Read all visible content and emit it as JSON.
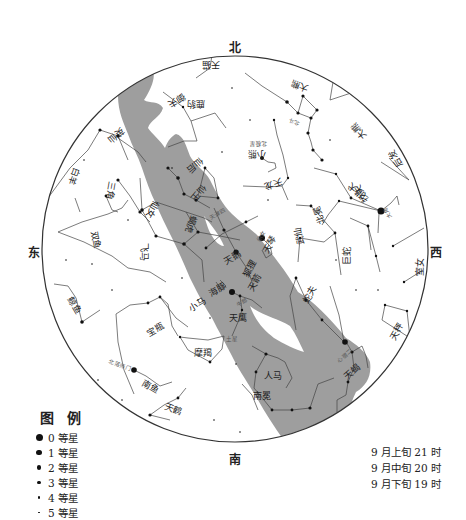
{
  "chart": {
    "center": [
      235,
      249
    ],
    "radius": 193,
    "milky_way_color": "#9e9e9e",
    "line_color": "#444444",
    "star_color": "#111111"
  },
  "cardinals": {
    "north": "北",
    "south": "南",
    "east": "东",
    "west": "西"
  },
  "legend": {
    "title": "图 例",
    "items": [
      {
        "label": "0 等星",
        "size": 7
      },
      {
        "label": "1 等星",
        "size": 5.5
      },
      {
        "label": "2 等星",
        "size": 4.2
      },
      {
        "label": "3 等星",
        "size": 3.2
      },
      {
        "label": "4 等星",
        "size": 2.4
      },
      {
        "label": "5 等星",
        "size": 1.6
      }
    ]
  },
  "time_notes": [
    "9 月上旬 21 时",
    "9 月中旬 20 时",
    "9 月下旬 19 时"
  ],
  "constellations": [
    {
      "name": "天猫",
      "x": 211,
      "y": 64,
      "rot": 180
    },
    {
      "name": "鹿豹",
      "x": 196,
      "y": 103,
      "rot": 180
    },
    {
      "name": "大熊",
      "x": 300,
      "y": 85,
      "rot": 200
    },
    {
      "name": "小熊",
      "x": 257,
      "y": 153,
      "rot": 180
    },
    {
      "name": "天龙",
      "x": 273,
      "y": 183,
      "rot": 160
    },
    {
      "name": "大熊",
      "x": 359,
      "y": 131,
      "rot": 230
    },
    {
      "name": "后发",
      "x": 396,
      "y": 158,
      "rot": 240
    },
    {
      "name": "猎犬",
      "x": 356,
      "y": 190,
      "rot": 220
    },
    {
      "name": "牧夫",
      "x": 362,
      "y": 193,
      "rot": 240
    },
    {
      "name": "北冕",
      "x": 320,
      "y": 215,
      "rot": 250
    },
    {
      "name": "武仙",
      "x": 300,
      "y": 236,
      "rot": 260
    },
    {
      "name": "巨蛇",
      "x": 347,
      "y": 256,
      "rot": 270
    },
    {
      "name": "室女",
      "x": 420,
      "y": 267,
      "rot": 270
    },
    {
      "name": "蛇夫",
      "x": 310,
      "y": 295,
      "rot": 300
    },
    {
      "name": "天秤",
      "x": 397,
      "y": 332,
      "rot": 300
    },
    {
      "name": "天蝎",
      "x": 352,
      "y": 372,
      "rot": 320
    },
    {
      "name": "人马",
      "x": 273,
      "y": 376,
      "rot": 0
    },
    {
      "name": "南冕",
      "x": 262,
      "y": 396,
      "rot": 0
    },
    {
      "name": "天鹰",
      "x": 238,
      "y": 318,
      "rot": 0
    },
    {
      "name": "天琴",
      "x": 270,
      "y": 245,
      "rot": 300
    },
    {
      "name": "天鹅",
      "x": 233,
      "y": 258,
      "rot": 330
    },
    {
      "name": "狐狸",
      "x": 250,
      "y": 269,
      "rot": 300
    },
    {
      "name": "天箭",
      "x": 255,
      "y": 283,
      "rot": 300
    },
    {
      "name": "海豚",
      "x": 218,
      "y": 290,
      "rot": 330
    },
    {
      "name": "小马",
      "x": 198,
      "y": 305,
      "rot": 330
    },
    {
      "name": "宝瓶",
      "x": 156,
      "y": 330,
      "rot": 330
    },
    {
      "name": "摩羯",
      "x": 203,
      "y": 353,
      "rot": 0
    },
    {
      "name": "南鱼",
      "x": 150,
      "y": 387,
      "rot": 30
    },
    {
      "name": "天鹤",
      "x": 173,
      "y": 410,
      "rot": 20
    },
    {
      "name": "鲸鱼",
      "x": 74,
      "y": 306,
      "rot": 60
    },
    {
      "name": "双鱼",
      "x": 95,
      "y": 240,
      "rot": 80
    },
    {
      "name": "飞马",
      "x": 143,
      "y": 252,
      "rot": 90
    },
    {
      "name": "蝎虎",
      "x": 190,
      "y": 224,
      "rot": 110
    },
    {
      "name": "仙女",
      "x": 152,
      "y": 209,
      "rot": 120
    },
    {
      "name": "仙王",
      "x": 198,
      "y": 193,
      "rot": 130
    },
    {
      "name": "仙后",
      "x": 195,
      "y": 165,
      "rot": 140
    },
    {
      "name": "三角",
      "x": 110,
      "y": 190,
      "rot": 100
    },
    {
      "name": "白羊",
      "x": 73,
      "y": 176,
      "rot": 110
    },
    {
      "name": "英仙",
      "x": 116,
      "y": 135,
      "rot": 140
    },
    {
      "name": "御夫",
      "x": 176,
      "y": 100,
      "rot": 150
    }
  ],
  "star_labels": [
    {
      "name": "北极星",
      "x": 258,
      "y": 143,
      "rot": 180
    },
    {
      "name": "北斗",
      "x": 294,
      "y": 121,
      "rot": 200
    },
    {
      "name": "大角",
      "x": 388,
      "y": 213,
      "rot": 240
    },
    {
      "name": "织女",
      "x": 262,
      "y": 236,
      "rot": 300
    },
    {
      "name": "天津四",
      "x": 218,
      "y": 214,
      "rot": 330
    },
    {
      "name": "牛郎",
      "x": 242,
      "y": 303,
      "rot": 330
    },
    {
      "name": "心宿二",
      "x": 345,
      "y": 356,
      "rot": 320
    },
    {
      "name": "土星",
      "x": 232,
      "y": 339,
      "rot": 0
    },
    {
      "name": "北落师门",
      "x": 120,
      "y": 366,
      "rot": 20
    }
  ]
}
